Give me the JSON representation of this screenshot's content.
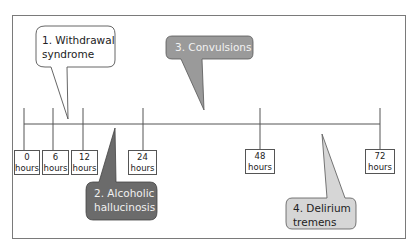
{
  "diagram": {
    "timeline": {
      "ticks": [
        {
          "value": "0",
          "unit": "hours"
        },
        {
          "value": "6",
          "unit": "hours"
        },
        {
          "value": "12",
          "unit": "hours"
        },
        {
          "value": "24",
          "unit": "hours"
        },
        {
          "value": "48",
          "unit": "hours"
        },
        {
          "value": "72",
          "unit": "hours"
        }
      ]
    },
    "callouts": [
      {
        "line1": "1. Withdrawal",
        "line2": "syndrome",
        "fill": "#ffffff",
        "text_color": "#222222"
      },
      {
        "line1": "2. Alcoholic",
        "line2": "hallucinosis",
        "fill": "#6b6b6b",
        "text_color": "#f0f0f0"
      },
      {
        "line1": "3. Convulsions",
        "line2": "",
        "fill": "#9a9a9a",
        "text_color": "#f2f2f2"
      },
      {
        "line1": "4. Delirium",
        "line2": "tremens",
        "fill": "#d6d6d6",
        "text_color": "#222222"
      }
    ]
  }
}
